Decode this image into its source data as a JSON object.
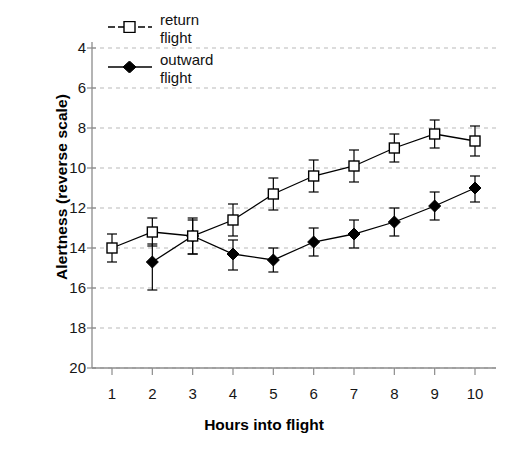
{
  "chart_data": {
    "type": "line",
    "title": "",
    "subtitle": "",
    "xlabel": "Hours into flight",
    "ylabel": "Alertness (reverse scale)",
    "x": [
      1,
      2,
      3,
      4,
      5,
      6,
      7,
      8,
      9,
      10
    ],
    "xtick_labels": [
      "1",
      "2",
      "3",
      "4",
      "5",
      "6",
      "7",
      "8",
      "9",
      "10"
    ],
    "ytick_labels": [
      "4",
      "6",
      "8",
      "10",
      "12",
      "14",
      "16",
      "18",
      "20"
    ],
    "yticks": [
      4,
      6,
      8,
      10,
      12,
      14,
      16,
      18,
      20
    ],
    "ylim": [
      4,
      20
    ],
    "xlim": [
      0.5,
      10.5
    ],
    "y_axis_inverted": true,
    "grid": "horizontal-dashed",
    "legend_position": "top-left-inside",
    "error_bars": "vertical-with-caps",
    "series": [
      {
        "name": "return flight",
        "marker": "open-square",
        "color": "#000000",
        "values": [
          14.0,
          13.2,
          13.4,
          12.6,
          11.3,
          10.4,
          9.9,
          9.0,
          8.3,
          8.65
        ],
        "err_low": [
          13.3,
          12.5,
          12.5,
          11.8,
          10.5,
          9.6,
          9.1,
          8.3,
          7.6,
          7.9
        ],
        "err_high": [
          14.7,
          13.9,
          14.3,
          13.4,
          12.1,
          11.2,
          10.7,
          9.7,
          9.0,
          9.4
        ]
      },
      {
        "name": "outward flight",
        "marker": "filled-diamond",
        "color": "#000000",
        "values": [
          null,
          14.7,
          13.4,
          14.3,
          14.6,
          13.7,
          13.3,
          12.7,
          11.9,
          11.0
        ],
        "err_low": [
          null,
          13.8,
          12.6,
          13.6,
          14.0,
          13.0,
          12.6,
          12.0,
          11.2,
          10.4
        ],
        "err_high": [
          null,
          16.1,
          14.3,
          15.1,
          15.2,
          14.4,
          14.0,
          13.4,
          12.6,
          11.7
        ]
      }
    ]
  },
  "legend": {
    "items": [
      {
        "label": "return\nflight",
        "marker": "open-square"
      },
      {
        "label": "outward\nflight",
        "marker": "filled-diamond"
      }
    ]
  },
  "axes": {
    "x_title": "Hours into flight",
    "y_title": "Alertness (reverse scale)"
  },
  "colors": {
    "ink": "#000000",
    "grid": "#b9b9b9",
    "axis": "#8c8c8c",
    "background": "#ffffff"
  }
}
